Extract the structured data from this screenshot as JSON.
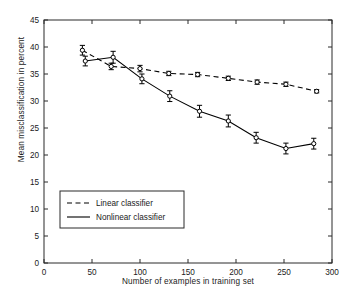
{
  "chart_data": {
    "type": "line",
    "title": "",
    "xlabel": "Number of examples in training set",
    "ylabel": "Mean misclassification in percent",
    "xlim": [
      0,
      300
    ],
    "ylim": [
      0,
      45
    ],
    "xticks": [
      0,
      50,
      100,
      150,
      200,
      250,
      300
    ],
    "yticks": [
      0,
      5,
      10,
      15,
      20,
      25,
      30,
      35,
      40,
      45
    ],
    "xtick_labels": [
      "0",
      "50",
      "100",
      "150",
      "200",
      "250",
      "300"
    ],
    "ytick_labels": [
      "0",
      "5",
      "10",
      "15",
      "20",
      "25",
      "30",
      "35",
      "40",
      "45"
    ],
    "grid": false,
    "legend_position": "lower left",
    "marker": "circle",
    "error_bars": true,
    "series": [
      {
        "name": "Linear classifier",
        "style": "dashed",
        "color": "#000000",
        "x": [
          40,
          70,
          100,
          130,
          160,
          192,
          222,
          252,
          284
        ],
        "y": [
          39.4,
          36.4,
          36.0,
          35.1,
          34.9,
          34.2,
          33.5,
          33.1,
          31.8
        ],
        "yerr": [
          0.9,
          0.6,
          0.6,
          0.4,
          0.4,
          0.4,
          0.4,
          0.4,
          0.3
        ]
      },
      {
        "name": "Nonlinear classifier",
        "style": "solid",
        "color": "#000000",
        "x": [
          43,
          72,
          102,
          131,
          162,
          192,
          221,
          252,
          281
        ],
        "y": [
          37.4,
          38.1,
          34.1,
          30.9,
          28.1,
          26.3,
          23.2,
          21.2,
          22.1
        ],
        "yerr": [
          0.9,
          1.1,
          0.9,
          1.0,
          1.1,
          1.1,
          1.0,
          1.0,
          1.0
        ]
      }
    ],
    "legend": [
      {
        "label": "Linear classifier",
        "style": "dashed"
      },
      {
        "label": "Nonlinear classifier",
        "style": "solid"
      }
    ]
  }
}
